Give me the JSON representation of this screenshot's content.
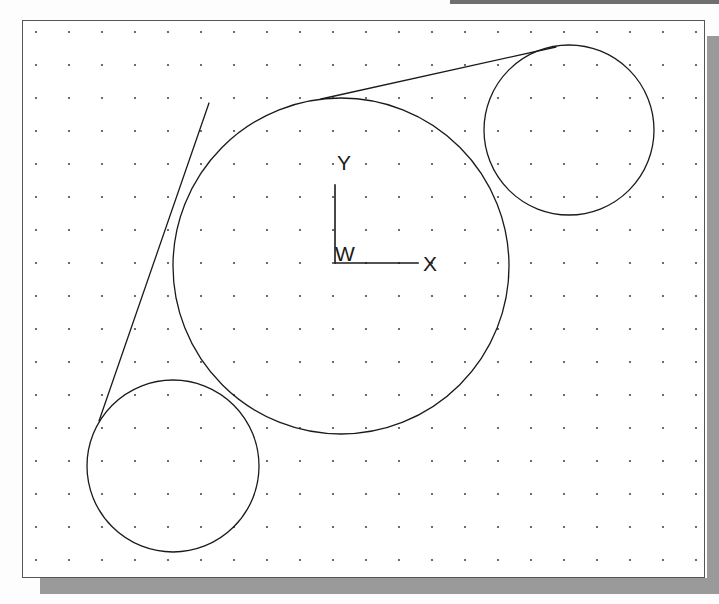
{
  "page": {
    "background_color": "#fdfdfd",
    "top_band_color": "#6f6f6f",
    "shadow_color": "#9a9a9a"
  },
  "frame": {
    "name": "cad-drawing-frame",
    "x": 22,
    "y": 20,
    "width": 683,
    "height": 558,
    "border_color": "#555555",
    "fill_color": "#ffffff"
  },
  "grid": {
    "name": "dot-grid",
    "spacing": 33,
    "origin_x": 13,
    "origin_y": 11,
    "dot_radius": 1.1,
    "dot_color": "#4a4a4a",
    "cols": 21,
    "rows": 17
  },
  "drawing": {
    "stroke_color": "#1a1a1a",
    "stroke_width": 1.3,
    "circles": [
      {
        "name": "large-circle",
        "cx": 318,
        "cy": 245,
        "r": 168
      },
      {
        "name": "top-right-circle",
        "cx": 546,
        "cy": 109,
        "r": 85
      },
      {
        "name": "bottom-left-circle",
        "cx": 150,
        "cy": 445,
        "r": 86
      }
    ],
    "tangent_lines": [
      {
        "name": "upper-tangent-line",
        "x1": 298,
        "y1": 78,
        "x2": 533,
        "y2": 26
      },
      {
        "name": "lower-tangent-line",
        "x1": 76,
        "y1": 400,
        "x2": 186,
        "y2": 82
      }
    ]
  },
  "coordinate_system": {
    "name": "wcs-icon",
    "origin_label": "W",
    "x_axis_label": "X",
    "y_axis_label": "Y",
    "origin_x": 312,
    "origin_y": 242,
    "x_axis_length": 83,
    "y_axis_length": 78,
    "axis_color": "#1a1a1a"
  },
  "labels": {
    "y": "Y",
    "x": "X",
    "w": "W"
  }
}
